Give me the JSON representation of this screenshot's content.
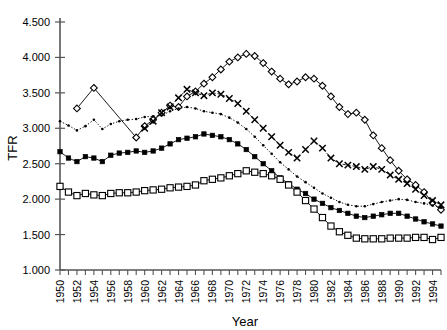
{
  "chart_data": {
    "type": "line",
    "title": "",
    "xlabel": "Year",
    "ylabel": "TFR",
    "xlim": [
      1950,
      1995
    ],
    "ylim": [
      1.0,
      4.5
    ],
    "ytick_labels": [
      "1.000",
      "1.500",
      "2.000",
      "2.500",
      "3.000",
      "3.500",
      "4.000",
      "4.500"
    ],
    "ytick_values": [
      1.0,
      1.5,
      2.0,
      2.5,
      3.0,
      3.5,
      4.0,
      4.5
    ],
    "xtick_labels": [
      "1950",
      "1952",
      "1954",
      "1956",
      "1958",
      "1960",
      "1962",
      "1964",
      "1966",
      "1968",
      "1970",
      "1972",
      "1974",
      "1976",
      "1978",
      "1980",
      "1982",
      "1984",
      "1986",
      "1988",
      "1990",
      "1992",
      "1994"
    ],
    "xtick_values": [
      1950,
      1952,
      1954,
      1956,
      1958,
      1960,
      1962,
      1964,
      1966,
      1968,
      1970,
      1972,
      1974,
      1976,
      1978,
      1980,
      1982,
      1984,
      1986,
      1988,
      1990,
      1992,
      1994
    ],
    "xtick_minor_step": 1,
    "grid": false,
    "legend": "none",
    "x": [
      1950,
      1951,
      1952,
      1953,
      1954,
      1955,
      1956,
      1957,
      1958,
      1959,
      1960,
      1961,
      1962,
      1963,
      1964,
      1965,
      1966,
      1967,
      1968,
      1969,
      1970,
      1971,
      1972,
      1973,
      1974,
      1975,
      1976,
      1977,
      1978,
      1979,
      1980,
      1981,
      1982,
      1983,
      1984,
      1985,
      1986,
      1987,
      1988,
      1989,
      1990,
      1991,
      1992,
      1993,
      1994,
      1995
    ],
    "series": [
      {
        "name": "open-diamond-series",
        "marker": "open-diamond",
        "line": "solid",
        "values": [
          null,
          null,
          3.28,
          null,
          3.57,
          null,
          null,
          null,
          null,
          2.87,
          3.03,
          3.12,
          3.22,
          3.32,
          3.3,
          3.45,
          3.52,
          3.63,
          3.72,
          3.83,
          3.94,
          4.0,
          4.05,
          4.02,
          3.92,
          3.8,
          3.7,
          3.62,
          3.66,
          3.72,
          3.7,
          3.6,
          3.45,
          3.3,
          3.2,
          3.22,
          3.12,
          2.9,
          2.72,
          2.55,
          2.4,
          2.28,
          2.2,
          2.1,
          1.95,
          1.85
        ]
      },
      {
        "name": "x-marker-series",
        "marker": "x",
        "line": "dash",
        "values": [
          null,
          null,
          null,
          null,
          null,
          null,
          null,
          null,
          null,
          null,
          3.0,
          3.1,
          3.22,
          3.3,
          3.43,
          3.55,
          3.5,
          3.46,
          3.5,
          3.48,
          3.42,
          3.35,
          3.24,
          3.12,
          3.0,
          2.88,
          2.76,
          2.66,
          2.58,
          2.7,
          2.82,
          2.72,
          2.58,
          2.5,
          2.48,
          2.46,
          2.42,
          2.46,
          2.42,
          2.34,
          2.28,
          2.22,
          2.14,
          2.05,
          1.98,
          1.92
        ]
      },
      {
        "name": "small-dot-series",
        "marker": "small-dot",
        "line": "dot",
        "values": [
          3.1,
          3.04,
          2.97,
          3.03,
          3.12,
          2.99,
          3.06,
          3.1,
          3.12,
          3.13,
          3.16,
          3.17,
          3.18,
          3.24,
          3.28,
          3.3,
          3.28,
          3.24,
          3.22,
          3.2,
          3.15,
          3.08,
          2.99,
          2.88,
          2.76,
          2.64,
          2.52,
          2.42,
          2.32,
          2.24,
          2.16,
          2.08,
          2.02,
          1.96,
          1.92,
          1.9,
          1.9,
          1.93,
          1.96,
          1.98,
          2.0,
          1.99,
          1.96,
          1.94,
          1.91,
          1.88
        ]
      },
      {
        "name": "filled-square-series",
        "marker": "filled-square",
        "line": "solid",
        "values": [
          2.67,
          2.58,
          2.53,
          2.6,
          2.58,
          2.53,
          2.62,
          2.65,
          2.66,
          2.68,
          2.66,
          2.68,
          2.72,
          2.78,
          2.84,
          2.86,
          2.88,
          2.92,
          2.9,
          2.88,
          2.84,
          2.78,
          2.7,
          2.6,
          2.5,
          2.4,
          2.3,
          2.22,
          2.14,
          2.08,
          2.0,
          1.94,
          1.88,
          1.84,
          1.8,
          1.76,
          1.74,
          1.76,
          1.78,
          1.8,
          1.8,
          1.76,
          1.72,
          1.68,
          1.65,
          1.62
        ]
      },
      {
        "name": "open-square-series",
        "marker": "open-square",
        "line": "solid",
        "values": [
          2.18,
          2.1,
          2.05,
          2.08,
          2.06,
          2.05,
          2.08,
          2.09,
          2.09,
          2.1,
          2.12,
          2.13,
          2.14,
          2.16,
          2.17,
          2.18,
          2.2,
          2.26,
          2.28,
          2.3,
          2.33,
          2.36,
          2.4,
          2.38,
          2.36,
          2.33,
          2.28,
          2.2,
          2.1,
          1.98,
          1.86,
          1.74,
          1.62,
          1.54,
          1.49,
          1.45,
          1.44,
          1.44,
          1.44,
          1.45,
          1.45,
          1.45,
          1.46,
          1.46,
          1.43,
          1.46
        ]
      }
    ]
  }
}
